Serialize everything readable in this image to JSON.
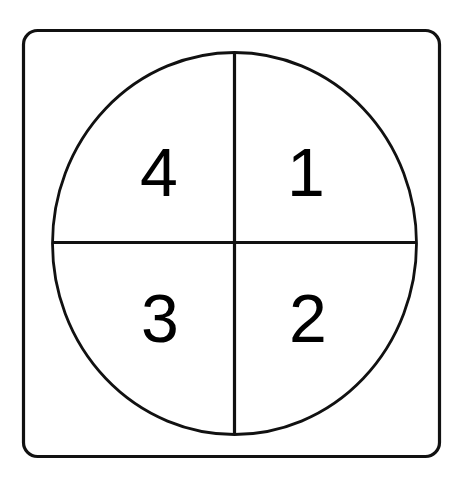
{
  "diagram": {
    "background_color": "#ffffff",
    "stroke_color": "#111111",
    "label_color": "#000000",
    "frame": {
      "name": "rounded-square-frame",
      "x": 23.5,
      "y": 30.5,
      "width": 416,
      "height": 426,
      "corner_radius": 14,
      "stroke_width": 3.2
    },
    "circle": {
      "name": "quadrant-circle",
      "center_x": 234.5,
      "center_y": 243.5,
      "radius_x": 182,
      "radius_y": 191,
      "stroke_width": 2.8
    },
    "vertical_divider": {
      "x": 234.5,
      "y1": 52,
      "y2": 435
    },
    "horizontal_divider": {
      "y": 242.5,
      "x1": 52,
      "x2": 417
    },
    "quadrants": [
      {
        "id": "quadrant-1",
        "label": "1",
        "position": "top-right",
        "x": 306,
        "y": 196
      },
      {
        "id": "quadrant-2",
        "label": "2",
        "position": "bottom-right",
        "x": 308,
        "y": 342
      },
      {
        "id": "quadrant-3",
        "label": "3",
        "position": "bottom-left",
        "x": 160,
        "y": 342
      },
      {
        "id": "quadrant-4",
        "label": "4",
        "position": "top-left",
        "x": 159,
        "y": 196
      }
    ]
  }
}
